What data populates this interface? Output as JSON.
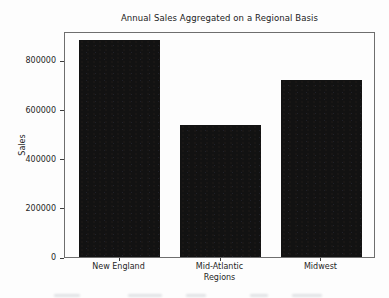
{
  "chart_data": {
    "type": "bar",
    "title": "Annual Sales Aggregated on a Regional Basis",
    "categories": [
      "New England",
      "Mid-Atlantic",
      "Midwest"
    ],
    "values": [
      884000,
      536000,
      719000
    ],
    "xlabel": "Regions",
    "ylabel": "Sales",
    "yticks": [
      0,
      200000,
      400000,
      600000,
      800000
    ],
    "ylim": [
      0,
      920000
    ],
    "xlim": [
      -0.54,
      2.54
    ],
    "bar_width_fraction": 0.8,
    "bar_color": "#121212",
    "frame_color": "#6e6e6e",
    "text_color": "#1f1f1f",
    "grid": false,
    "legend": null
  }
}
